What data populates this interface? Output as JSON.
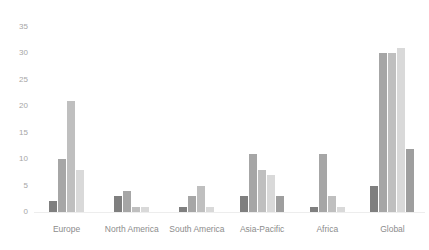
{
  "top_crop": {
    "sliver_text": "·   ··    ·      ···        ·    ····       ··        ·   ·····      ···   ·"
  },
  "colors": {
    "series_1": "#7f7f7f",
    "series_2": "#a6a6a6",
    "series_3": "#bfbfbf",
    "series_4": "#d9d9d9",
    "series_5": "#9e9e9e",
    "axis_text": "#a6a6a6",
    "label_text": "#8c8c8c",
    "baseline": "#ededed",
    "background": "#ffffff"
  },
  "chart_data": {
    "type": "bar",
    "title": "",
    "subtitle": "",
    "xlabel": "",
    "ylabel": "",
    "ylim": [
      0,
      35
    ],
    "yticks": [
      0,
      5,
      10,
      15,
      20,
      25,
      30,
      35
    ],
    "grid": false,
    "legend": "none",
    "orientation": "vertical",
    "grouping": "clustered",
    "categories": [
      "Europe",
      "North America",
      "South America",
      "Asia-Pacific",
      "Africa",
      "Global"
    ],
    "series": [
      {
        "name": "Series 1",
        "color": "#7f7f7f",
        "values": [
          2,
          3,
          1,
          3,
          1,
          5
        ]
      },
      {
        "name": "Series 2",
        "color": "#a6a6a6",
        "values": [
          10,
          4,
          3,
          11,
          11,
          30
        ]
      },
      {
        "name": "Series 3",
        "color": "#bfbfbf",
        "values": [
          21,
          1,
          5,
          8,
          3,
          30
        ]
      },
      {
        "name": "Series 4",
        "color": "#d9d9d9",
        "values": [
          8,
          1,
          1,
          7,
          1,
          31
        ]
      },
      {
        "name": "Series 5",
        "color": "#9e9e9e",
        "values": [
          null,
          null,
          null,
          3,
          null,
          12
        ]
      }
    ]
  }
}
